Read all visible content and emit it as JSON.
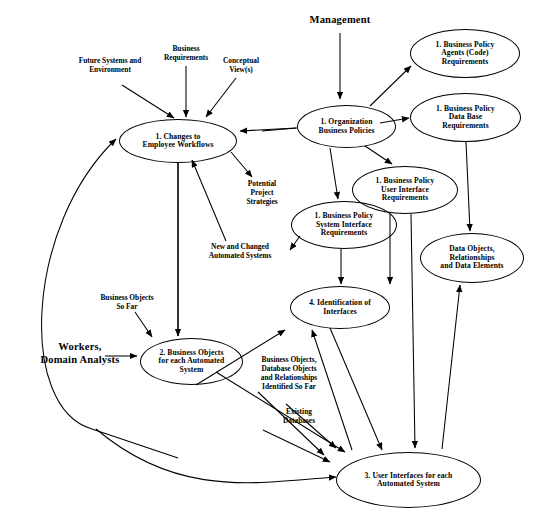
{
  "diagram": {
    "type": "data-flow-diagram",
    "stroke_color": "#000000",
    "background_color": "#ffffff",
    "nodes": [
      {
        "id": "changes-employee-workflows",
        "label": "1.  Changes to\nEmployee Workflows",
        "lines": [
          "1.  Changes to",
          "Employee Workflows"
        ],
        "shape": "ellipse",
        "x": 119,
        "y": 119,
        "w": 118,
        "h": 44
      },
      {
        "id": "organization-business-policies",
        "label": "1. Organization\nBusiness Policies",
        "lines": [
          "1. Organization",
          "Business Policies"
        ],
        "shape": "ellipse",
        "x": 297,
        "y": 105,
        "w": 99,
        "h": 43
      },
      {
        "id": "business-policy-agents-code-requirements",
        "label": "1. Business Policy\nAgents (Code)\nRequirements",
        "lines": [
          "1. Business Policy",
          "Agents (Code)",
          "Requirements"
        ],
        "shape": "ellipse",
        "x": 410,
        "y": 29,
        "w": 110,
        "h": 49
      },
      {
        "id": "business-policy-data-base-requirements",
        "label": "1. Business Policy\nData Base\nRequirements",
        "lines": [
          "1. Business Policy",
          "Data Base",
          "Requirements"
        ],
        "shape": "ellipse",
        "x": 410,
        "y": 93,
        "w": 111,
        "h": 49
      },
      {
        "id": "business-policy-user-interface-requirements",
        "label": "1. Business Policy\nUser Interface\nRequirements",
        "lines": [
          "1. Business Policy",
          "User Interface",
          "Requirements"
        ],
        "shape": "ellipse",
        "x": 352,
        "y": 166,
        "w": 106,
        "h": 48
      },
      {
        "id": "business-policy-system-interface-requirements",
        "label": "1. Business Policy\nSystem Interface\nRequirements",
        "lines": [
          "1. Business Policy",
          "System Interface",
          "Requirements"
        ],
        "shape": "ellipse",
        "x": 291,
        "y": 201,
        "w": 106,
        "h": 48
      },
      {
        "id": "data-objects-relationships-data-elements",
        "label": "Data Objects,\nRelationships\nand Data Elements",
        "lines": [
          "Data Objects,",
          "Relationships",
          "and Data Elements"
        ],
        "shape": "ellipse",
        "x": 420,
        "y": 233,
        "w": 104,
        "h": 50
      },
      {
        "id": "identification-of-interfaces",
        "label": "4. Identification of\nInterfaces",
        "lines": [
          "4. Identification of",
          "Interfaces"
        ],
        "shape": "ellipse",
        "x": 290,
        "y": 286,
        "w": 100,
        "h": 43
      },
      {
        "id": "business-objects-each-automated-system",
        "label": "2. Business Objects\nfor each Automated\nSystem",
        "lines": [
          "2. Business Objects",
          "for each Automated",
          "System"
        ],
        "shape": "ellipse",
        "x": 140,
        "y": 338,
        "w": 103,
        "h": 47
      },
      {
        "id": "user-interfaces-each-automated-system",
        "label": "3. User Interfaces for each\nAutomated System",
        "lines": [
          "3. User Interfaces for each",
          "Automated System",
          ""
        ],
        "shape": "ellipse",
        "x": 336,
        "y": 452,
        "w": 145,
        "h": 56
      }
    ],
    "flow_labels": [
      {
        "id": "management",
        "text": "Management",
        "style": "strong",
        "x": 290,
        "y": 14,
        "w": 100
      },
      {
        "id": "future-systems-and-environment",
        "text": "Future Systems and\nEnvironment",
        "style": "normal",
        "x": 62,
        "y": 57,
        "w": 96
      },
      {
        "id": "business-requirements",
        "text": "Business\nRequirements",
        "style": "normal",
        "x": 151,
        "y": 45,
        "w": 70
      },
      {
        "id": "conceptual-views",
        "text": "Conceptual\nView(s)",
        "style": "normal",
        "x": 210,
        "y": 57,
        "w": 62
      },
      {
        "id": "potential-project-strategies",
        "text": "Potential\nProject\nStrategies",
        "style": "normal",
        "x": 233,
        "y": 180,
        "w": 58
      },
      {
        "id": "new-and-changed-automated-systems",
        "text": "New and Changed\nAutomated Systems",
        "style": "normal",
        "x": 193,
        "y": 243,
        "w": 94
      },
      {
        "id": "business-objects-so-far",
        "text": "Business Objects\nSo Far",
        "style": "normal",
        "x": 84,
        "y": 294,
        "w": 86
      },
      {
        "id": "workers-domain-analysts",
        "text": "Workers,\nDomain Analysts",
        "style": "strong",
        "x": 27,
        "y": 341,
        "w": 106
      },
      {
        "id": "business-objects-database-objects-identified",
        "text": "Business Objects,\nDatabase Objects\nand Relationships\nIdentified So Far",
        "style": "normal",
        "x": 243,
        "y": 356,
        "w": 92
      },
      {
        "id": "existing-databases",
        "text": "Existing\nDatabases",
        "style": "normal",
        "x": 264,
        "y": 408,
        "w": 70
      }
    ],
    "edges": [
      {
        "from": "management",
        "to": "organization-business-policies"
      },
      {
        "from": "future-systems-and-environment",
        "to": "changes-employee-workflows"
      },
      {
        "from": "business-requirements",
        "to": "changes-employee-workflows"
      },
      {
        "from": "conceptual-views",
        "to": "changes-employee-workflows"
      },
      {
        "from": "organization-business-policies",
        "to": "changes-employee-workflows"
      },
      {
        "from": "organization-business-policies",
        "to": "business-policy-agents-code-requirements"
      },
      {
        "from": "organization-business-policies",
        "to": "business-policy-data-base-requirements"
      },
      {
        "from": "organization-business-policies",
        "to": "business-policy-user-interface-requirements"
      },
      {
        "from": "organization-business-policies",
        "to": "business-policy-system-interface-requirements"
      },
      {
        "from": "business-policy-data-base-requirements",
        "to": "data-objects-relationships-data-elements"
      },
      {
        "from": "business-policy-user-interface-requirements",
        "to": "identification-of-interfaces"
      },
      {
        "from": "business-policy-system-interface-requirements",
        "to": "identification-of-interfaces"
      },
      {
        "from": "changes-employee-workflows",
        "to": "potential-project-strategies"
      },
      {
        "from": "changes-employee-workflows",
        "to": "business-objects-each-automated-system"
      },
      {
        "from": "new-and-changed-automated-systems",
        "to": "changes-employee-workflows"
      },
      {
        "from": "business-objects-so-far",
        "to": "business-objects-each-automated-system"
      },
      {
        "from": "workers-domain-analysts",
        "to": "business-objects-each-automated-system"
      },
      {
        "from": "workers-domain-analysts",
        "to": "changes-employee-workflows"
      },
      {
        "from": "business-objects-each-automated-system",
        "to": "user-interfaces-each-automated-system"
      },
      {
        "from": "identification-of-interfaces",
        "to": "user-interfaces-each-automated-system"
      },
      {
        "from": "user-interfaces-each-automated-system",
        "to": "identification-of-interfaces"
      },
      {
        "from": "user-interfaces-each-automated-system",
        "to": "data-objects-relationships-data-elements"
      },
      {
        "from": "business-policy-user-interface-requirements",
        "to": "user-interfaces-each-automated-system"
      },
      {
        "from": "existing-databases",
        "to": "user-interfaces-each-automated-system"
      }
    ]
  }
}
